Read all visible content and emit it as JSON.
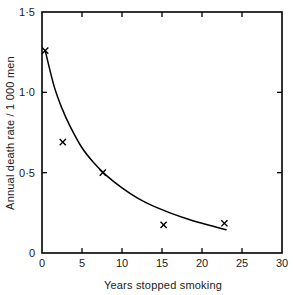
{
  "chart_data": {
    "type": "scatter",
    "title": "",
    "subtitle": "",
    "xlabel": "Years stopped smoking",
    "ylabel": "Annual death rate / 1 000 men",
    "xlim": [
      0,
      30
    ],
    "ylim": [
      0,
      1.5
    ],
    "grid": false,
    "legend": null,
    "x_ticks": [
      0,
      5,
      10,
      15,
      20,
      25,
      30
    ],
    "x_tick_labels": [
      "0",
      "5",
      "10",
      "15",
      "20",
      "25",
      "30"
    ],
    "y_ticks": [
      0,
      0.5,
      1.0,
      1.5
    ],
    "y_tick_labels": [
      "0",
      "0·5",
      "1·0",
      "1·5"
    ],
    "marker": "x",
    "marker_color": "#000000",
    "line_color": "#000000",
    "points": [
      {
        "x": 0.4,
        "y": 1.26
      },
      {
        "x": 2.6,
        "y": 0.69
      },
      {
        "x": 7.6,
        "y": 0.5
      },
      {
        "x": 15.2,
        "y": 0.175
      },
      {
        "x": 22.8,
        "y": 0.185
      }
    ],
    "series": [
      {
        "name": "fitted exponential decay curve",
        "x": [
          0.4,
          1.5,
          2.5,
          3.5,
          5,
          6.5,
          8,
          10,
          12,
          14,
          16,
          18,
          20,
          21.5,
          23
        ],
        "y": [
          1.26,
          1.04,
          0.9,
          0.79,
          0.655,
          0.56,
          0.485,
          0.405,
          0.34,
          0.29,
          0.25,
          0.215,
          0.185,
          0.165,
          0.145
        ]
      }
    ]
  },
  "figure": {
    "background_color": "#ffffff",
    "frame_color": "#000000"
  }
}
